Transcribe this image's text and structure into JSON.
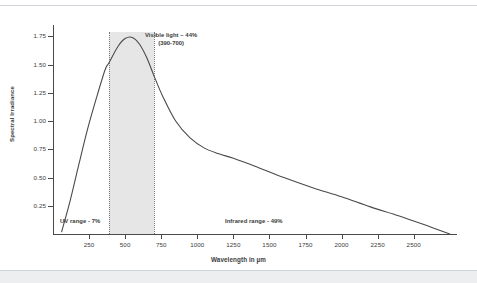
{
  "chart_data": {
    "type": "line",
    "title": "",
    "xlabel": "Wavelength in µm",
    "ylabel": "Spectral Irradiance",
    "xlim": [
      0,
      2800
    ],
    "ylim": [
      0,
      1.85
    ],
    "grid": false,
    "legend": "none",
    "xticks": [
      250,
      500,
      750,
      1000,
      1250,
      1500,
      1750,
      2000,
      2250,
      2500
    ],
    "xtick_labels": [
      "250",
      "500",
      "750",
      "1000",
      "1250",
      "1500",
      "1750",
      "2000",
      "2250",
      "2500"
    ],
    "yticks": [
      0.25,
      0.5,
      0.75,
      1.0,
      1.25,
      1.5,
      1.75
    ],
    "ytick_labels": [
      "0.25",
      "0.50",
      "0.75",
      "1.00",
      "1.25",
      "1.50",
      "1.75"
    ],
    "series": [
      {
        "name": "Solar spectral irradiance",
        "color": "#4a4a4a",
        "x": [
          60,
          120,
          180,
          240,
          300,
          360,
          390,
          450,
          500,
          550,
          600,
          650,
          700,
          760,
          850,
          950,
          1050,
          1150,
          1250,
          1400,
          1600,
          1800,
          2000,
          2200,
          2400,
          2600,
          2750
        ],
        "y": [
          0.02,
          0.3,
          0.62,
          0.93,
          1.2,
          1.45,
          1.52,
          1.66,
          1.73,
          1.74,
          1.68,
          1.56,
          1.4,
          1.22,
          1.0,
          0.85,
          0.76,
          0.71,
          0.67,
          0.6,
          0.5,
          0.41,
          0.33,
          0.24,
          0.16,
          0.07,
          0.0
        ]
      }
    ],
    "shaded_regions": [
      {
        "name": "visible-light-band",
        "x_start": 390,
        "x_end": 700,
        "color": "#e2e2e2",
        "edge_style": "dotted",
        "edge_color": "#7a7a7a"
      }
    ],
    "annotations": [
      {
        "name": "visible-light-annotation",
        "line1": "Visible light – 44%",
        "line2": "(390-700)"
      },
      {
        "name": "uv-range-annotation",
        "text": "UV range - 7%"
      },
      {
        "name": "infrared-range-annotation",
        "text": "Infrared range - 49%"
      }
    ]
  },
  "figure": {
    "y_axis_title": "Spectral Irradiance",
    "x_axis_title": "Wavelength in µm",
    "visible_label_line1": "Visible light – 44%",
    "visible_label_line2": "(390-700)",
    "uv_label": "UV range - 7%",
    "infrared_label": "Infrared range - 49%"
  },
  "colors": {
    "curve": "#4a4a4a",
    "band_fill": "#e2e2e2",
    "band_edge": "#7a7a7a",
    "axis": "#4a4a4a",
    "text": "#3b3b3b",
    "page_rule": "#cfd2d6",
    "page_band": "#eceef0"
  }
}
